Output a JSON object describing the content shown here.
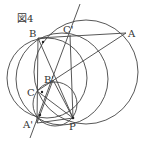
{
  "figure": {
    "title": "図4",
    "points": {
      "A": {
        "label": "A",
        "x": 126,
        "y": 33
      },
      "B": {
        "label": "B",
        "x": 38,
        "y": 38
      },
      "C_prime": {
        "label": "C'",
        "x": 70,
        "y": 35
      },
      "B_prime": {
        "label": "B'",
        "x": 53,
        "y": 80
      },
      "C": {
        "label": "C",
        "x": 37,
        "y": 91
      },
      "A_prime": {
        "label": "A'",
        "x": 37,
        "y": 123
      },
      "P": {
        "label": "P",
        "x": 73,
        "y": 118
      }
    },
    "colors": {
      "stroke": "#444444",
      "text": "#333333"
    }
  }
}
